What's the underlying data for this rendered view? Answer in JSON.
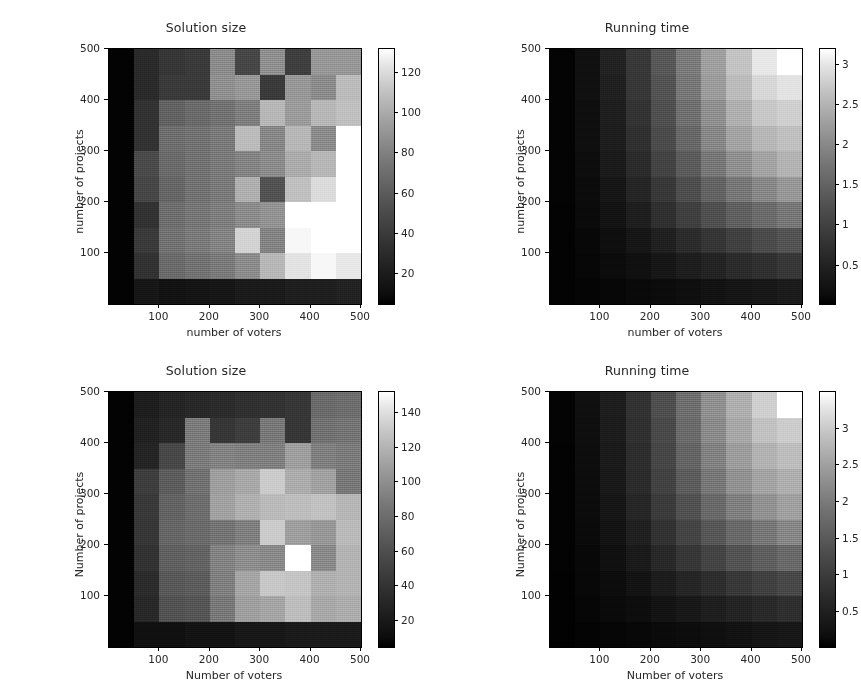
{
  "figure": {
    "width": 861,
    "height": 699,
    "background": "#ffffff",
    "colormap": "gray",
    "panel_count": 4
  },
  "chart_data": [
    {
      "id": "top-left",
      "type": "heatmap",
      "title": "Solution size",
      "xlabel": "number of voters",
      "ylabel": "number of projects",
      "xticks": [
        100,
        200,
        300,
        400,
        500
      ],
      "yticks": [
        100,
        200,
        300,
        400,
        500
      ],
      "xlim": [
        0,
        500
      ],
      "ylim": [
        0,
        500
      ],
      "grid": false,
      "colorbar": {
        "position": "right",
        "ticks": [
          20,
          40,
          60,
          80,
          100,
          120
        ],
        "vmin": 5,
        "vmax": 132,
        "colormap": "gray"
      },
      "x": [
        25,
        75,
        125,
        175,
        225,
        275,
        325,
        375,
        425,
        475
      ],
      "y": [
        25,
        75,
        125,
        175,
        225,
        275,
        325,
        375,
        425,
        475
      ],
      "values": [
        [
          6,
          16,
          14,
          15,
          16,
          18,
          18,
          20,
          20,
          22
        ],
        [
          6,
          30,
          58,
          62,
          66,
          74,
          96,
          118,
          128,
          120
        ],
        [
          6,
          34,
          62,
          66,
          70,
          110,
          70,
          128,
          132,
          132
        ],
        [
          6,
          30,
          60,
          64,
          68,
          74,
          78,
          132,
          132,
          132
        ],
        [
          6,
          40,
          56,
          62,
          66,
          92,
          46,
          100,
          114,
          132
        ],
        [
          6,
          42,
          58,
          62,
          66,
          70,
          74,
          90,
          96,
          132
        ],
        [
          6,
          30,
          60,
          62,
          66,
          98,
          72,
          96,
          74,
          132
        ],
        [
          6,
          30,
          54,
          58,
          62,
          68,
          96,
          82,
          96,
          100
        ],
        [
          6,
          26,
          34,
          34,
          76,
          80,
          34,
          80,
          74,
          98
        ],
        [
          6,
          26,
          32,
          34,
          74,
          40,
          76,
          36,
          80,
          80
        ]
      ]
    },
    {
      "id": "top-right",
      "type": "heatmap",
      "title": "Running time",
      "xlabel": "number of voters",
      "ylabel": "number of projects",
      "xticks": [
        100,
        200,
        300,
        400,
        500
      ],
      "yticks": [
        100,
        200,
        300,
        400,
        500
      ],
      "xlim": [
        0,
        500
      ],
      "ylim": [
        0,
        500
      ],
      "grid": false,
      "colorbar": {
        "position": "right",
        "ticks": [
          0.5,
          1.0,
          1.5,
          2.0,
          2.5,
          3.0
        ],
        "vmin": 0.02,
        "vmax": 3.2,
        "colormap": "gray"
      },
      "x": [
        25,
        75,
        125,
        175,
        225,
        275,
        325,
        375,
        425,
        475
      ],
      "y": [
        25,
        75,
        125,
        175,
        225,
        275,
        325,
        375,
        425,
        475
      ],
      "values": [
        [
          0.05,
          0.07,
          0.1,
          0.13,
          0.16,
          0.2,
          0.24,
          0.28,
          0.32,
          0.36
        ],
        [
          0.05,
          0.1,
          0.16,
          0.22,
          0.3,
          0.38,
          0.46,
          0.55,
          0.62,
          0.7
        ],
        [
          0.05,
          0.12,
          0.2,
          0.3,
          0.42,
          0.55,
          0.68,
          0.82,
          0.95,
          1.05
        ],
        [
          0.05,
          0.14,
          0.26,
          0.4,
          0.6,
          0.8,
          1.0,
          1.2,
          1.35,
          1.5
        ],
        [
          0.06,
          0.16,
          0.3,
          0.48,
          0.72,
          0.98,
          1.25,
          1.5,
          1.7,
          1.9
        ],
        [
          0.06,
          0.18,
          0.34,
          0.56,
          0.85,
          1.15,
          1.5,
          1.8,
          2.05,
          2.25
        ],
        [
          0.06,
          0.2,
          0.38,
          0.62,
          0.95,
          1.3,
          1.7,
          2.05,
          2.3,
          2.4
        ],
        [
          0.06,
          0.2,
          0.4,
          0.66,
          1.0,
          1.4,
          1.8,
          2.2,
          2.5,
          2.6
        ],
        [
          0.06,
          0.22,
          0.42,
          0.7,
          1.05,
          1.5,
          1.95,
          2.35,
          2.7,
          2.85
        ],
        [
          0.06,
          0.22,
          0.44,
          0.72,
          1.1,
          1.55,
          2.0,
          2.45,
          2.9,
          3.2
        ]
      ]
    },
    {
      "id": "bottom-left",
      "type": "heatmap",
      "title": "Solution size",
      "xlabel": "Number of voters",
      "ylabel": "Number of projects",
      "xticks": [
        100,
        200,
        300,
        400,
        500
      ],
      "yticks": [
        100,
        200,
        300,
        400,
        500
      ],
      "xlim": [
        0,
        500
      ],
      "ylim": [
        0,
        500
      ],
      "grid": false,
      "colorbar": {
        "position": "right",
        "ticks": [
          20,
          40,
          60,
          80,
          100,
          120,
          140
        ],
        "vmin": 5,
        "vmax": 152,
        "colormap": "gray"
      },
      "x": [
        25,
        75,
        125,
        175,
        225,
        275,
        325,
        375,
        425,
        475
      ],
      "y": [
        25,
        75,
        125,
        175,
        225,
        275,
        325,
        375,
        425,
        475
      ],
      "values": [
        [
          6,
          14,
          14,
          16,
          16,
          18,
          18,
          20,
          20,
          20
        ],
        [
          6,
          28,
          52,
          54,
          74,
          96,
          100,
          114,
          102,
          104
        ],
        [
          6,
          30,
          56,
          58,
          78,
          100,
          120,
          118,
          106,
          108
        ],
        [
          6,
          34,
          60,
          62,
          80,
          86,
          84,
          152,
          84,
          108
        ],
        [
          6,
          36,
          64,
          66,
          72,
          78,
          122,
          96,
          92,
          112
        ],
        [
          6,
          38,
          62,
          68,
          98,
          106,
          112,
          114,
          116,
          110
        ],
        [
          6,
          40,
          58,
          70,
          96,
          102,
          122,
          104,
          98,
          74
        ],
        [
          6,
          26,
          46,
          76,
          80,
          78,
          78,
          96,
          78,
          76
        ],
        [
          6,
          24,
          28,
          76,
          36,
          40,
          74,
          36,
          70,
          72
        ],
        [
          6,
          22,
          26,
          28,
          30,
          32,
          34,
          36,
          66,
          68
        ]
      ]
    },
    {
      "id": "bottom-right",
      "type": "heatmap",
      "title": "Running time",
      "xlabel": "Number of voters",
      "ylabel": "Number of projects",
      "xticks": [
        100,
        200,
        300,
        400,
        500
      ],
      "yticks": [
        100,
        200,
        300,
        400,
        500
      ],
      "xlim": [
        0,
        500
      ],
      "ylim": [
        0,
        500
      ],
      "grid": false,
      "colorbar": {
        "position": "right",
        "ticks": [
          0.5,
          1.0,
          1.5,
          2.0,
          2.5,
          3.0
        ],
        "vmin": 0.02,
        "vmax": 3.5,
        "colormap": "gray"
      },
      "x": [
        25,
        75,
        125,
        175,
        225,
        275,
        325,
        375,
        425,
        475
      ],
      "y": [
        25,
        75,
        125,
        175,
        225,
        275,
        325,
        375,
        425,
        475
      ],
      "values": [
        [
          0.04,
          0.06,
          0.09,
          0.12,
          0.15,
          0.18,
          0.22,
          0.26,
          0.3,
          0.34
        ],
        [
          0.04,
          0.09,
          0.15,
          0.2,
          0.28,
          0.35,
          0.43,
          0.5,
          0.58,
          0.65
        ],
        [
          0.04,
          0.11,
          0.19,
          0.28,
          0.4,
          0.52,
          0.64,
          0.78,
          0.9,
          1.0
        ],
        [
          0.05,
          0.13,
          0.24,
          0.38,
          0.56,
          0.76,
          0.95,
          1.15,
          1.3,
          1.45
        ],
        [
          0.05,
          0.15,
          0.28,
          0.46,
          0.7,
          0.95,
          1.2,
          1.45,
          1.65,
          1.85
        ],
        [
          0.05,
          0.17,
          0.32,
          0.54,
          0.82,
          1.12,
          1.45,
          1.75,
          2.0,
          2.2
        ],
        [
          0.05,
          0.19,
          0.36,
          0.6,
          0.92,
          1.28,
          1.65,
          2.0,
          2.25,
          2.4
        ],
        [
          0.05,
          0.2,
          0.38,
          0.64,
          0.98,
          1.38,
          1.78,
          2.15,
          2.45,
          2.6
        ],
        [
          0.06,
          0.21,
          0.4,
          0.68,
          1.02,
          1.46,
          1.9,
          2.3,
          2.65,
          2.8
        ],
        [
          0.06,
          0.22,
          0.42,
          0.7,
          1.08,
          1.52,
          1.98,
          2.4,
          2.85,
          3.5
        ]
      ]
    }
  ]
}
